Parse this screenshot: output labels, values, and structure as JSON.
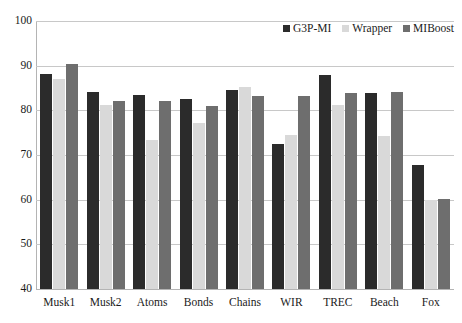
{
  "chart_data": {
    "type": "bar",
    "title": "",
    "subtitle": "",
    "xlabel": "",
    "ylabel": "",
    "ylim": [
      40,
      100
    ],
    "ytick_step": 10,
    "yticks": [
      100,
      90,
      80,
      70,
      60,
      50,
      40
    ],
    "grid": true,
    "legend_position": "top-right",
    "categories": [
      "Musk1",
      "Musk2",
      "Atoms",
      "Bonds",
      "Chains",
      "WIR",
      "TREC",
      "Beach",
      "Fox"
    ],
    "series": [
      {
        "name": "G3P-MI",
        "color": "#2b2b2b",
        "values": [
          88.2,
          84.0,
          83.5,
          82.5,
          84.5,
          72.5,
          88.0,
          83.8,
          67.8
        ]
      },
      {
        "name": "Wrapper",
        "color": "#d9d9d9",
        "values": [
          87.0,
          81.2,
          73.4,
          77.2,
          85.3,
          74.5,
          81.2,
          74.3,
          60.0
        ]
      },
      {
        "name": "MIBoost",
        "color": "#6e6e6e",
        "values": [
          90.3,
          82.2,
          82.0,
          81.0,
          83.3,
          83.3,
          83.8,
          84.0,
          60.2
        ]
      }
    ]
  },
  "legend": {
    "items": [
      {
        "label": "G3P-MI"
      },
      {
        "label": "Wrapper"
      },
      {
        "label": "MIBoost"
      }
    ]
  }
}
